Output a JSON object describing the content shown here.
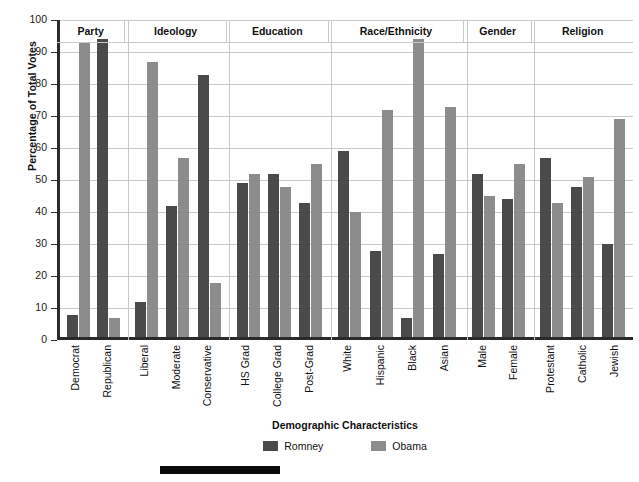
{
  "chart_data": {
    "type": "bar",
    "title": "",
    "xlabel": "Demographic Characteristics",
    "ylabel": "Percentage of Total Votes",
    "ylim": [
      0,
      100
    ],
    "ytick_step": 10,
    "yticks": [
      100,
      90,
      80,
      70,
      60,
      50,
      40,
      30,
      20,
      10,
      0
    ],
    "grid": true,
    "legend_position": "bottom",
    "categories": [
      "Democrat",
      "Republican",
      "Liberal",
      "Moderate",
      "Conservative",
      "HS Grad",
      "College Grad",
      "Post-Grad",
      "White",
      "Hispanic",
      "Black",
      "Asian",
      "Male",
      "Female",
      "Protestant",
      "Catholic",
      "Jewish"
    ],
    "series": [
      {
        "name": "Romney",
        "color": "#4a4a4a",
        "values": [
          7,
          93,
          11,
          41,
          82,
          48,
          51,
          42,
          58,
          27,
          6,
          26,
          51,
          43,
          56,
          47,
          29
        ]
      },
      {
        "name": "Obama",
        "color": "#8c8c8c",
        "values": [
          92,
          6,
          86,
          56,
          17,
          51,
          47,
          54,
          39,
          71,
          93,
          72,
          44,
          54,
          42,
          50,
          68
        ]
      }
    ],
    "groups": [
      {
        "label": "Party",
        "categories": [
          {
            "label": "Democrat",
            "romney": 7,
            "obama": 92
          },
          {
            "label": "Republican",
            "romney": 93,
            "obama": 6
          }
        ]
      },
      {
        "label": "Ideology",
        "categories": [
          {
            "label": "Liberal",
            "romney": 11,
            "obama": 86
          },
          {
            "label": "Moderate",
            "romney": 41,
            "obama": 56
          },
          {
            "label": "Conservative",
            "romney": 82,
            "obama": 17
          }
        ]
      },
      {
        "label": "Education",
        "categories": [
          {
            "label": "HS Grad",
            "romney": 48,
            "obama": 51
          },
          {
            "label": "College Grad",
            "romney": 51,
            "obama": 47
          },
          {
            "label": "Post-Grad",
            "romney": 42,
            "obama": 54
          }
        ]
      },
      {
        "label": "Race/Ethnicity",
        "categories": [
          {
            "label": "White",
            "romney": 58,
            "obama": 39
          },
          {
            "label": "Hispanic",
            "romney": 27,
            "obama": 71
          },
          {
            "label": "Black",
            "romney": 6,
            "obama": 93
          },
          {
            "label": "Asian",
            "romney": 26,
            "obama": 72
          }
        ]
      },
      {
        "label": "Gender",
        "categories": [
          {
            "label": "Male",
            "romney": 51,
            "obama": 44
          },
          {
            "label": "Female",
            "romney": 43,
            "obama": 54
          }
        ]
      },
      {
        "label": "Religion",
        "categories": [
          {
            "label": "Protestant",
            "romney": 56,
            "obama": 42
          },
          {
            "label": "Catholic",
            "romney": 47,
            "obama": 50
          },
          {
            "label": "Jewish",
            "romney": 29,
            "obama": 68
          }
        ]
      }
    ]
  },
  "legend": {
    "items": [
      {
        "label": "Romney",
        "color": "#4a4a4a"
      },
      {
        "label": "Obama",
        "color": "#8c8c8c"
      }
    ]
  },
  "colors": {
    "romney": "#4a4a4a",
    "obama": "#8c8c8c",
    "axis": "#2b2b2b",
    "grid": "#c9c9c9",
    "rule": "#0a0a0a"
  }
}
